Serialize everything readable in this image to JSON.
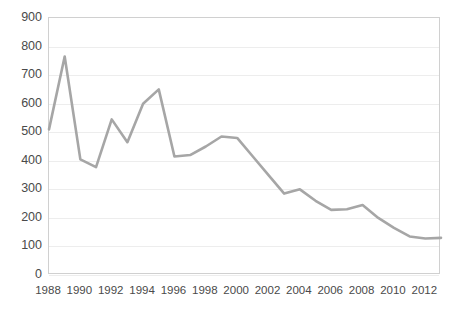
{
  "chart_data": {
    "type": "line",
    "title": "",
    "subtitle": "",
    "xlabel": "",
    "ylabel": "",
    "xlim": [
      1988,
      2013
    ],
    "ylim": [
      0,
      900
    ],
    "ytick_step": 100,
    "yticks": [
      900,
      800,
      700,
      600,
      500,
      400,
      300,
      200,
      100,
      0
    ],
    "xticks": [
      1988,
      1990,
      1992,
      1994,
      1996,
      1998,
      2000,
      2002,
      2004,
      2006,
      2008,
      2010,
      2012
    ],
    "grid": "horizontal",
    "legend": "none",
    "line_color": "#a6a6a6",
    "line_width": 2.6,
    "markers": "none",
    "x": [
      1988,
      1989,
      1990,
      1991,
      1992,
      1993,
      1994,
      1995,
      1996,
      1997,
      1998,
      1999,
      2000,
      2001,
      2002,
      2003,
      2004,
      2005,
      2006,
      2007,
      2008,
      2009,
      2010,
      2011,
      2012,
      2013
    ],
    "series": [
      {
        "name": "series-1",
        "values": [
          510,
          765,
          405,
          378,
          545,
          465,
          600,
          650,
          415,
          420,
          450,
          485,
          480,
          415,
          350,
          285,
          300,
          260,
          228,
          230,
          245,
          200,
          165,
          135,
          128,
          130
        ]
      }
    ]
  },
  "axes": {
    "y_tick_labels": [
      "900",
      "800",
      "700",
      "600",
      "500",
      "400",
      "300",
      "200",
      "100",
      "0"
    ],
    "x_tick_labels": [
      "1988",
      "1990",
      "1992",
      "1994",
      "1996",
      "1998",
      "2000",
      "2002",
      "2004",
      "2006",
      "2008",
      "2010",
      "2012"
    ]
  },
  "colors": {
    "line": "#a6a6a6",
    "grid": "#ededed",
    "frame": "#d0d0d0",
    "text": "#4a4a4a",
    "background": "#ffffff"
  }
}
